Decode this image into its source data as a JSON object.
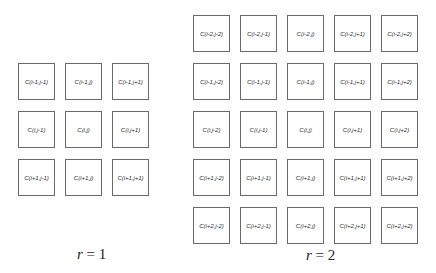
{
  "diagrams": [
    {
      "name": "r1",
      "caption": {
        "var": "r",
        "rest": " = 1"
      },
      "cells": [
        [
          "C(i-1,j-1)",
          "C(i-1,j)",
          "C(i-1,j+1)"
        ],
        [
          "C(i,j-1)",
          "C(i,j)",
          "C(i,j+1)"
        ],
        [
          "C(i+1,j-1)",
          "C(i+1,j)",
          "C(i+1,j+1)"
        ]
      ]
    },
    {
      "name": "r2",
      "caption": {
        "var": "r",
        "rest": " = 2"
      },
      "cells": [
        [
          "C(i-2,j-2)",
          "C(i-2,j-1)",
          "C(i-2,j)",
          "C(i-2,j+1)",
          "C(i-2,j+2)"
        ],
        [
          "C(i-1,j-2)",
          "C(i-1,j-1)",
          "C(i-1,j)",
          "C(i-1,j+1)",
          "C(i-1,j+2)"
        ],
        [
          "C(i,j-2)",
          "C(i,j-1)",
          "C(i,j)",
          "C(i,j+1)",
          "C(i,j+2)"
        ],
        [
          "C(i+1,j-2)",
          "C(i+1,j-1)",
          "C(i+1,j)",
          "C(i+1,j+1)",
          "C(i+1,j+2)"
        ],
        [
          "C(i+2,j-2)",
          "C(i+2,j-1)",
          "C(i+2,j)",
          "C(i+2,j+1)",
          "C(i+2,j+2)"
        ]
      ]
    }
  ]
}
